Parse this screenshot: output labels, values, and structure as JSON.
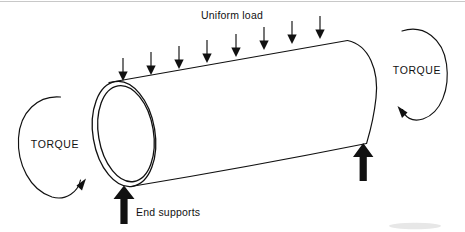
{
  "figure": {
    "title_visible": false,
    "background_color": "#ffffff",
    "ink_color": "#111111",
    "width": 465,
    "height": 232
  },
  "labels": {
    "uniform_load": "Uniform load",
    "torque_left": "TORQUE",
    "torque_right": "TORQUE",
    "end_supports": "End supports"
  },
  "load_arrows": {
    "count": 8,
    "direction": "down",
    "positions_x": [
      123,
      151,
      180,
      208,
      236,
      264,
      292,
      320
    ],
    "tip_y": [
      80,
      74,
      68,
      62,
      56,
      50,
      44,
      39
    ],
    "tail_y": [
      58,
      52,
      46,
      40,
      34,
      28,
      22,
      17
    ]
  },
  "support_arrows": {
    "count": 2,
    "direction": "up",
    "left_label": "End supports",
    "positions": [
      {
        "x": 124,
        "y_tip": 186,
        "y_tail": 224
      },
      {
        "x": 363,
        "y_tip": 143,
        "y_tail": 180
      }
    ]
  },
  "torque_loops": [
    {
      "side": "left",
      "rotation_sense": "counterclockwise",
      "center_x": 55,
      "center_y": 145
    },
    {
      "side": "right",
      "rotation_sense": "clockwise",
      "center_x": 417,
      "center_y": 72
    }
  ],
  "cylinder": {
    "type": "hollow-tube",
    "left_end": "double-ellipse-ring",
    "right_end": "single-arc",
    "top_edge_from": [
      108,
      82
    ],
    "top_edge_to": [
      348,
      40
    ],
    "bottom_edge_from": [
      130,
      186
    ],
    "bottom_edge_to": [
      367,
      143
    ]
  }
}
